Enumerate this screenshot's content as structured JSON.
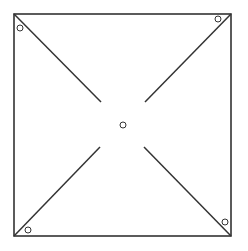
{
  "diagram": {
    "type": "pinwheel-template",
    "stroke_color": "#333333",
    "background": "#ffffff",
    "square": {
      "x": 14,
      "y": 14,
      "w": 217,
      "h": 222
    },
    "center_hole": {
      "cx": 123,
      "cy": 125,
      "r": 3
    },
    "corner_holes": [
      {
        "cx": 20,
        "cy": 28,
        "r": 3
      },
      {
        "cx": 218,
        "cy": 19,
        "r": 3
      },
      {
        "cx": 28,
        "cy": 230,
        "r": 3
      },
      {
        "cx": 225,
        "cy": 222,
        "r": 3
      }
    ],
    "cut_lines": [
      {
        "x1": 14,
        "y1": 14,
        "x2": 101,
        "y2": 102
      },
      {
        "x1": 231,
        "y1": 14,
        "x2": 145,
        "y2": 102
      },
      {
        "x1": 14,
        "y1": 236,
        "x2": 100,
        "y2": 147
      },
      {
        "x1": 231,
        "y1": 236,
        "x2": 144,
        "y2": 147
      }
    ]
  }
}
